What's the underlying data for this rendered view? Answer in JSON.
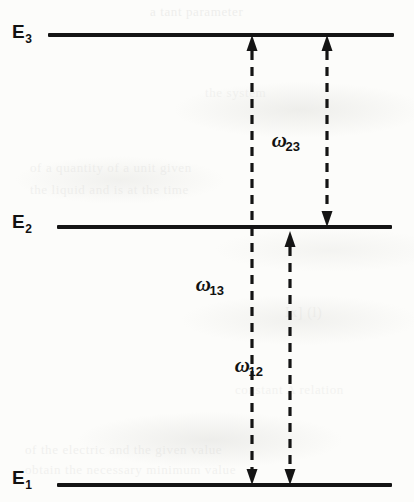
{
  "figure": {
    "background_color": "#fcfcfa",
    "ink_color": "#141414",
    "width": 414,
    "height": 502
  },
  "levels": [
    {
      "id": "E3",
      "symbol": "E",
      "subscript": "3",
      "label": "E₃",
      "y": 35,
      "x_start": 48,
      "x_end": 394,
      "thickness": 4,
      "label_x": 12,
      "label_y": 21
    },
    {
      "id": "E2",
      "symbol": "E",
      "subscript": "2",
      "label": "E₂",
      "y": 227,
      "x_start": 57,
      "x_end": 392,
      "thickness": 4,
      "label_x": 12,
      "label_y": 211
    },
    {
      "id": "E1",
      "symbol": "E",
      "subscript": "1",
      "label": "E₁",
      "y": 485,
      "x_start": 57,
      "x_end": 392,
      "thickness": 4,
      "label_x": 12,
      "label_y": 467
    }
  ],
  "transitions": [
    {
      "id": "w13",
      "symbol": "ω",
      "subscript": "13",
      "label": "ω₁₃",
      "from_level": "E1",
      "to_level": "E3",
      "x": 252,
      "y_top": 35,
      "y_bottom": 485,
      "arrow_heads": "both",
      "style": "dashed",
      "label_x": 228,
      "label_y": 272
    },
    {
      "id": "w23",
      "symbol": "ω",
      "subscript": "23",
      "label": "ω₂₃",
      "from_level": "E2",
      "to_level": "E3",
      "x": 327,
      "y_top": 35,
      "y_bottom": 227,
      "arrow_heads": "both",
      "style": "dashed",
      "label_x": 304,
      "label_y": 128
    },
    {
      "id": "w12",
      "symbol": "ω",
      "subscript": "12",
      "label": "ω₁₂",
      "from_level": "E1",
      "to_level": "E2",
      "x": 290,
      "y_top": 231,
      "y_bottom": 485,
      "arrow_heads": "both",
      "style": "dashed",
      "label_x": 267,
      "label_y": 353
    }
  ],
  "scan_artifacts": [
    {
      "text": "a tant parameter",
      "x": 150,
      "y": 4,
      "size": 13,
      "opacity": 0.38
    },
    {
      "text": "the  system",
      "x": 205,
      "y": 85,
      "size": 13,
      "opacity": 0.26
    },
    {
      "text": "of a quantity of a unit given",
      "x": 30,
      "y": 160,
      "size": 13,
      "opacity": 0.3
    },
    {
      "text": "the liquid and is at the time",
      "x": 30,
      "y": 182,
      "size": 13,
      "opacity": 0.3
    },
    {
      "text": "Ix] (l)",
      "x": 285,
      "y": 305,
      "size": 14,
      "opacity": 0.26
    },
    {
      "text": "constant  A  relation",
      "x": 235,
      "y": 382,
      "size": 13,
      "opacity": 0.26
    },
    {
      "text": "of the electric and the given value",
      "x": 25,
      "y": 442,
      "size": 13,
      "opacity": 0.32
    },
    {
      "text": "obtain  the  necessary  minimum  value",
      "x": 25,
      "y": 462,
      "size": 13,
      "opacity": 0.3
    }
  ]
}
